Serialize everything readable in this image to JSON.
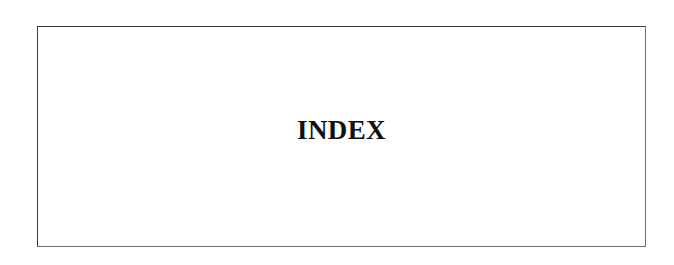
{
  "document": {
    "page_kind": "index-section-divider",
    "background_color": "#ffffff"
  },
  "frame": {
    "border_color": "#3a3a3a",
    "fill_color": "#ffffff",
    "shadow_color": "#6e6e6e"
  },
  "heading": {
    "text": "INDEX",
    "color": "#111111"
  },
  "body": {
    "content": ""
  }
}
